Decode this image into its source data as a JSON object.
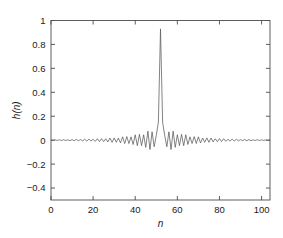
{
  "chart_data": {
    "type": "line",
    "title": "",
    "xlabel": "n",
    "ylabel": "h(n)",
    "xlim": [
      0,
      104
    ],
    "ylim": [
      -0.5,
      1.0
    ],
    "grid": false,
    "legend": null,
    "x_ticks": [
      0,
      20,
      40,
      60,
      80,
      100
    ],
    "x_tick_labels": [
      "0",
      "20",
      "40",
      "60",
      "80",
      "100"
    ],
    "y_ticks": [
      -0.4,
      -0.2,
      0,
      0.2,
      0.4,
      0.6,
      0.8,
      1
    ],
    "y_tick_labels": [
      "-0.4",
      "-0.2",
      "0",
      "0.2",
      "0.4",
      "0.6",
      "0.8",
      "1"
    ],
    "line_color": "#5a5a5a",
    "series": [
      {
        "name": "h(n)",
        "peak_index": 52,
        "peak_value": 0.93,
        "x": [
          0,
          1,
          2,
          3,
          4,
          5,
          6,
          7,
          8,
          9,
          10,
          11,
          12,
          13,
          14,
          15,
          16,
          17,
          18,
          19,
          20,
          21,
          22,
          23,
          24,
          25,
          26,
          27,
          28,
          29,
          30,
          31,
          32,
          33,
          34,
          35,
          36,
          37,
          38,
          39,
          40,
          41,
          42,
          43,
          44,
          45,
          46,
          47,
          48,
          49,
          50,
          51,
          52,
          53,
          54,
          55,
          56,
          57,
          58,
          59,
          60,
          61,
          62,
          63,
          64,
          65,
          66,
          67,
          68,
          69,
          70,
          71,
          72,
          73,
          74,
          75,
          76,
          77,
          78,
          79,
          80,
          81,
          82,
          83,
          84,
          85,
          86,
          87,
          88,
          89,
          90,
          91,
          92,
          93,
          94,
          95,
          96,
          97,
          98,
          99,
          100,
          101,
          102,
          103,
          104
        ],
        "values": [
          0.0,
          -0.001,
          0.002,
          -0.002,
          0.003,
          -0.003,
          0.004,
          -0.003,
          0.003,
          -0.004,
          0.005,
          -0.005,
          0.006,
          -0.005,
          0.005,
          -0.006,
          0.008,
          -0.008,
          0.009,
          -0.008,
          0.008,
          -0.01,
          0.012,
          -0.012,
          0.013,
          -0.012,
          0.012,
          -0.015,
          0.018,
          -0.018,
          0.019,
          -0.018,
          0.018,
          -0.023,
          0.028,
          -0.028,
          0.03,
          -0.028,
          0.028,
          -0.036,
          0.045,
          -0.046,
          0.049,
          -0.046,
          0.045,
          -0.06,
          0.075,
          -0.078,
          0.07,
          -0.055,
          0.04,
          0.15,
          0.93,
          0.15,
          0.04,
          -0.055,
          0.07,
          -0.078,
          0.075,
          -0.06,
          0.045,
          -0.046,
          0.049,
          -0.046,
          0.045,
          -0.036,
          0.028,
          -0.028,
          0.03,
          -0.028,
          0.028,
          -0.023,
          0.018,
          -0.018,
          0.019,
          -0.018,
          0.018,
          -0.015,
          0.012,
          -0.012,
          0.013,
          -0.012,
          0.012,
          -0.01,
          0.008,
          -0.008,
          0.009,
          -0.008,
          0.008,
          -0.006,
          0.005,
          -0.005,
          0.006,
          -0.005,
          0.005,
          -0.004,
          0.003,
          -0.003,
          0.004,
          -0.003,
          0.003,
          -0.002,
          0.002,
          -0.001,
          0.0
        ]
      }
    ]
  }
}
